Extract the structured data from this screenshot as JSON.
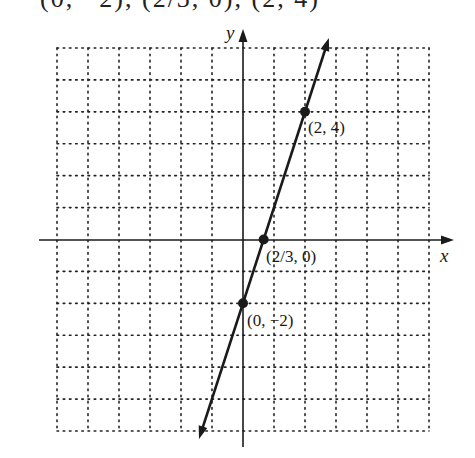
{
  "caption": "(0, −2), (2/3, 0), (2, 4)",
  "chart_data": {
    "type": "line",
    "title": "",
    "xlabel": "x",
    "ylabel": "y",
    "xlim": [
      -6,
      6
    ],
    "ylim": [
      -6,
      6
    ],
    "grid": true,
    "grid_style": "dotted",
    "series": [
      {
        "name": "y = 3x - 2",
        "equation": "y = 3x - 2",
        "x": [
          -1.42,
          2.77
        ],
        "y": [
          -6.25,
          6.31
        ],
        "arrows_both_ends": true
      }
    ],
    "points": [
      {
        "x": 2,
        "y": 4,
        "label": "(2, 4)"
      },
      {
        "x": 0.6667,
        "y": 0,
        "label": "(2/3, 0)"
      },
      {
        "x": 0,
        "y": -2,
        "label": "(0, −2)"
      }
    ]
  },
  "labels": {
    "x_axis": "x",
    "y_axis": "y",
    "p1": "(2, 4)",
    "p2": "(2/3, 0)",
    "p3": "(0, −2)"
  }
}
